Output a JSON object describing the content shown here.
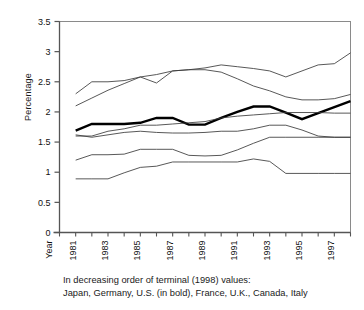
{
  "chart_data": {
    "type": "line",
    "title": "",
    "xlabel": "Year",
    "ylabel": "Percentage",
    "ylim": [
      0,
      3.5
    ],
    "xlim": [
      1980,
      1998
    ],
    "ytick_labels": [
      "0",
      "0.5",
      "1",
      "1.5",
      "2",
      "2.5",
      "3",
      "3.5"
    ],
    "ytick_values": [
      0,
      0.5,
      1,
      1.5,
      2,
      2.5,
      3,
      3.5
    ],
    "xtick_values": [
      1980,
      1981,
      1982,
      1983,
      1984,
      1985,
      1986,
      1987,
      1988,
      1989,
      1990,
      1991,
      1992,
      1993,
      1994,
      1995,
      1996,
      1997,
      1998
    ],
    "xtick_labels": [
      "",
      "1981",
      "",
      "1983",
      "",
      "1985",
      "",
      "1987",
      "",
      "1989",
      "",
      "1991",
      "",
      "1993",
      "",
      "1995",
      "",
      "1997",
      ""
    ],
    "x_axis_name_label": "Year",
    "grid": false,
    "legend_position": "caption-below",
    "x": [
      1981,
      1982,
      1983,
      1984,
      1985,
      1986,
      1987,
      1988,
      1989,
      1990,
      1991,
      1992,
      1993,
      1994,
      1995,
      1996,
      1997,
      1998
    ],
    "series": [
      {
        "name": "Japan",
        "bold": false,
        "color": "#3a3a3a",
        "terminal_value": 2.98,
        "values": [
          2.1,
          2.23,
          2.36,
          2.47,
          2.58,
          2.62,
          2.68,
          2.7,
          2.73,
          2.78,
          2.75,
          2.72,
          2.68,
          2.58,
          2.68,
          2.78,
          2.8,
          2.98
        ]
      },
      {
        "name": "Germany",
        "bold": false,
        "color": "#3a3a3a",
        "terminal_value": 2.29,
        "values": [
          2.3,
          2.5,
          2.5,
          2.52,
          2.58,
          2.48,
          2.68,
          2.7,
          2.7,
          2.66,
          2.55,
          2.43,
          2.35,
          2.25,
          2.2,
          2.2,
          2.22,
          2.29
        ]
      },
      {
        "name": "U.S.",
        "bold": true,
        "color": "#000000",
        "terminal_value": 2.18,
        "values": [
          1.69,
          1.8,
          1.8,
          1.8,
          1.82,
          1.9,
          1.9,
          1.79,
          1.79,
          1.9,
          2.0,
          2.09,
          2.09,
          1.99,
          1.88,
          1.98,
          2.08,
          2.18
        ]
      },
      {
        "name": "France",
        "bold": false,
        "color": "#3a3a3a",
        "terminal_value": 1.98,
        "values": [
          1.6,
          1.6,
          1.68,
          1.72,
          1.78,
          1.78,
          1.8,
          1.82,
          1.84,
          1.9,
          1.93,
          1.95,
          1.97,
          1.99,
          1.99,
          1.99,
          1.98,
          1.98
        ]
      },
      {
        "name": "U.K.",
        "bold": false,
        "color": "#3a3a3a",
        "terminal_value": 1.58,
        "values": [
          1.62,
          1.58,
          1.62,
          1.66,
          1.68,
          1.66,
          1.65,
          1.65,
          1.66,
          1.68,
          1.68,
          1.72,
          1.78,
          1.78,
          1.7,
          1.6,
          1.58,
          1.58
        ]
      },
      {
        "name": "Canada",
        "bold": false,
        "color": "#3a3a3a",
        "terminal_value": 1.58,
        "values": [
          1.2,
          1.29,
          1.29,
          1.3,
          1.38,
          1.38,
          1.38,
          1.28,
          1.27,
          1.28,
          1.37,
          1.48,
          1.58,
          1.58,
          1.58,
          1.58,
          1.58,
          1.58
        ]
      },
      {
        "name": "Italy",
        "bold": false,
        "color": "#3a3a3a",
        "terminal_value": 0.98,
        "values": [
          0.89,
          0.89,
          0.89,
          0.99,
          1.08,
          1.1,
          1.17,
          1.17,
          1.17,
          1.17,
          1.17,
          1.22,
          1.18,
          0.98,
          0.98,
          0.98,
          0.98,
          0.98
        ]
      }
    ],
    "caption_line1": "In decreasing order of terminal (1998) values:",
    "caption_line2": "Japan, Germany, U.S. (in bold), France, U.K., Canada, Italy"
  },
  "axis_color": "#6e6e6e",
  "plot_border_color": "#8a8a8a"
}
